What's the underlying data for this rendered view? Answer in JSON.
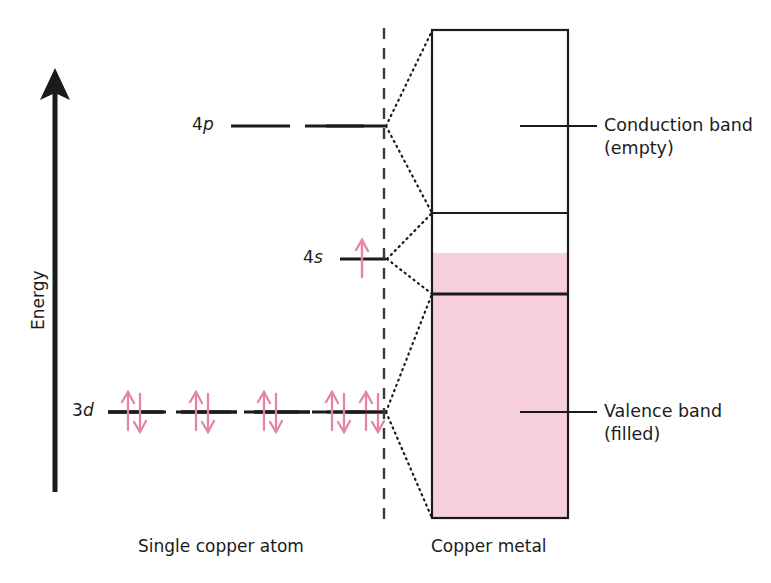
{
  "figure": {
    "background_color": "#ffffff",
    "line_color": "#1b1b1b",
    "electron_color": "#e4869f",
    "band_fill_color": "#f7cedd"
  },
  "axis": {
    "label": "Energy",
    "direction": "up",
    "arrow_name": "energy-axis-arrow"
  },
  "atom_side": {
    "caption": "Single copper atom",
    "levels": [
      {
        "id": "4p",
        "label_prefix": "4",
        "label_italic": "p",
        "label": "4p",
        "orbital_count": 3,
        "electrons_per_orbital": 0,
        "occupancy": "empty"
      },
      {
        "id": "4s",
        "label_prefix": "4",
        "label_italic": "s",
        "label": "4s",
        "orbital_count": 1,
        "electrons_per_orbital": 1,
        "occupancy": "half-filled (one unpaired electron)"
      },
      {
        "id": "3d",
        "label_prefix": "3",
        "label_italic": "d",
        "label": "3d",
        "orbital_count": 5,
        "electrons_per_orbital": 2,
        "occupancy": "filled (paired electrons)"
      }
    ]
  },
  "metal_side": {
    "caption": "Copper metal",
    "bands": [
      {
        "id": "conduction",
        "label_line1": "Conduction band",
        "label_line2": "(empty)",
        "fill": "empty"
      },
      {
        "id": "valence",
        "label_line1": "Valence band",
        "label_line2": "(filled)",
        "fill": "filled"
      }
    ]
  },
  "divider": {
    "name": "atom-metal-divider",
    "style": "dashed-vertical"
  }
}
